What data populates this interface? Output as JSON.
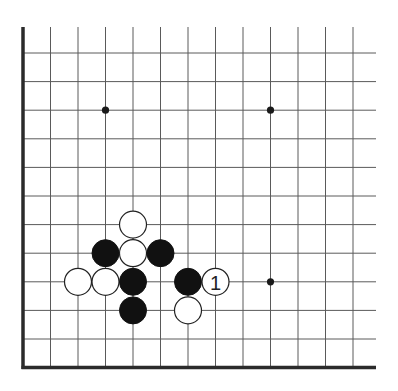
{
  "diagram": {
    "type": "go-board-fragment",
    "corner": "bottom-left",
    "columns_visible": 13,
    "rows_visible": 12,
    "geometry": {
      "origin_x": 23,
      "origin_y": 53,
      "spacing_x": 27.5,
      "spacing_y": 28.6,
      "top_extent_y": 27,
      "right_extent_x": 376,
      "stone_radius": 13.5
    },
    "star_points": [
      {
        "col": 3,
        "row": 2
      },
      {
        "col": 9,
        "row": 2
      },
      {
        "col": 9,
        "row": 8
      }
    ],
    "stones": [
      {
        "color": "white",
        "col": 4,
        "row": 6,
        "label": ""
      },
      {
        "color": "black",
        "col": 3,
        "row": 7,
        "label": ""
      },
      {
        "color": "white",
        "col": 4,
        "row": 7,
        "label": ""
      },
      {
        "color": "black",
        "col": 5,
        "row": 7,
        "label": ""
      },
      {
        "color": "white",
        "col": 2,
        "row": 8,
        "label": ""
      },
      {
        "color": "white",
        "col": 3,
        "row": 8,
        "label": ""
      },
      {
        "color": "black",
        "col": 4,
        "row": 8,
        "label": ""
      },
      {
        "color": "black",
        "col": 6,
        "row": 8,
        "label": ""
      },
      {
        "color": "white",
        "col": 7,
        "row": 8,
        "label": "1"
      },
      {
        "color": "black",
        "col": 4,
        "row": 9,
        "label": ""
      },
      {
        "color": "white",
        "col": 6,
        "row": 9,
        "label": ""
      }
    ],
    "move_labels": [
      "1"
    ]
  }
}
